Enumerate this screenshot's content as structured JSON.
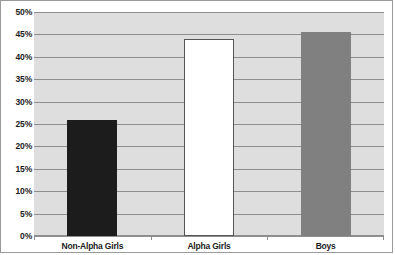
{
  "chart_data": {
    "type": "bar",
    "title": "",
    "subtitle": "",
    "xlabel": "",
    "ylabel": "",
    "categories": [
      "Non-Alpha Girls",
      "Alpha Girls",
      "Boys"
    ],
    "values": [
      26,
      44,
      45.5
    ],
    "ylim": [
      0,
      50
    ],
    "ytick_labels": [
      "0%",
      "5%",
      "10%",
      "15%",
      "20%",
      "25%",
      "30%",
      "35%",
      "40%",
      "45%",
      "50%"
    ],
    "ytick_values": [
      0,
      5,
      10,
      15,
      20,
      25,
      30,
      35,
      40,
      45,
      50
    ],
    "grid": true,
    "legend": "none",
    "bar_colors": [
      "#1c1c1c",
      "#ffffff",
      "#808080"
    ],
    "bar_edge_colors": [
      "#1c1c1c",
      "#555555",
      "#808080"
    ],
    "plot_background": "#dedede",
    "gridline_color": "#8e8e8e",
    "frame_color": "#9a9a9a",
    "text_color": "#1c1c1c"
  }
}
